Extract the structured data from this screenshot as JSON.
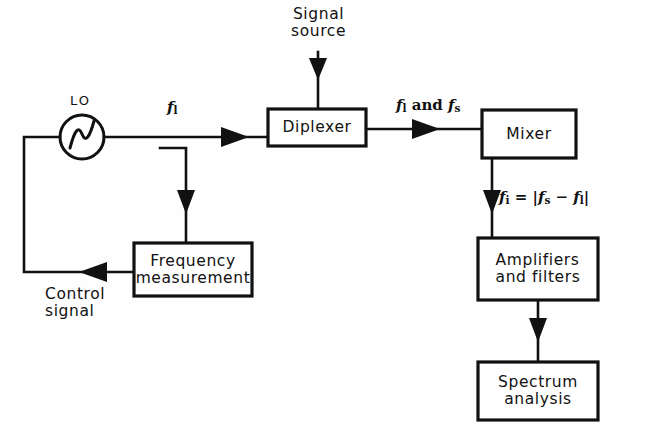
{
  "diagram": {
    "background_color": "#fefefe",
    "line_color": "#111111"
  },
  "blocks": [
    {
      "id": "diplexer",
      "label": "Diplexer",
      "x": 268,
      "y": 109,
      "w": 98,
      "h": 37
    },
    {
      "id": "mixer",
      "label": "Mixer",
      "x": 482,
      "y": 110,
      "w": 94,
      "h": 48
    },
    {
      "id": "frequency",
      "label": "Frequency\nmeasurement",
      "x": 134,
      "y": 243,
      "w": 118,
      "h": 53
    },
    {
      "id": "amplifiers",
      "label": "Amplifiers\nand filters",
      "x": 478,
      "y": 238,
      "w": 120,
      "h": 62
    },
    {
      "id": "spectrum",
      "label": "Spectrum\nanalysis",
      "x": 478,
      "y": 362,
      "w": 120,
      "h": 58
    }
  ],
  "oscillator": {
    "tag": "LO",
    "tag_x": 70,
    "tag_y": 93,
    "cx": 82,
    "cy": 137,
    "r": 22
  },
  "labels": {
    "signal_source": {
      "text": "Signal\nsource",
      "x": 291,
      "y": 6
    },
    "control_signal": {
      "text": "Control\nsignal",
      "x": 45,
      "y": 286
    }
  },
  "signal_labels": [
    {
      "id": "f-lo",
      "html": "<i>f</i><sub>l</sub>",
      "x": 167,
      "y": 98
    },
    {
      "id": "f-lo-and-s",
      "html": "<i>f</i><sub>l</sub> and <i>f</i><sub>s</sub>",
      "x": 396,
      "y": 96
    },
    {
      "id": "f-if",
      "html": "<i>f</i><sub>i</sub> = |<i>f</i><sub>s</sub> &#8722; <i>f</i><sub>l</sub>|",
      "x": 499,
      "y": 188
    }
  ],
  "connections": [
    {
      "id": "signal-source-to-diplexer",
      "from": "signal source",
      "to": "diplexer",
      "direction": "down"
    },
    {
      "id": "lo-to-diplexer",
      "from": "LO",
      "to": "diplexer",
      "direction": "right",
      "signal": "f_l"
    },
    {
      "id": "lo-tap-to-frequency",
      "from": "LO line tap",
      "to": "frequency measurement",
      "direction": "down"
    },
    {
      "id": "frequency-to-lo",
      "from": "frequency measurement",
      "to": "LO",
      "direction": "left",
      "signal": "Control signal"
    },
    {
      "id": "diplexer-to-mixer",
      "from": "diplexer",
      "to": "mixer",
      "direction": "right",
      "signal": "f_l and f_s"
    },
    {
      "id": "mixer-to-amplifiers",
      "from": "mixer",
      "to": "amplifiers and filters",
      "direction": "down",
      "signal": "f_i = |f_s - f_l|"
    },
    {
      "id": "amplifiers-to-spectrum",
      "from": "amplifiers and filters",
      "to": "spectrum analysis",
      "direction": "down"
    }
  ]
}
